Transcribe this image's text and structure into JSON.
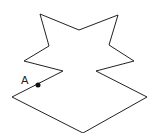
{
  "diagram": {
    "type": "polygon",
    "stroke_color": "#222222",
    "fill_color": "#ffffff",
    "vertices": [
      [
        40,
        14
      ],
      [
        79,
        30
      ],
      [
        118,
        15
      ],
      [
        109,
        45
      ],
      [
        134,
        61
      ],
      [
        96,
        71
      ],
      [
        147,
        97
      ],
      [
        83,
        133
      ],
      [
        12,
        97
      ],
      [
        63,
        71
      ],
      [
        24,
        61
      ],
      [
        49,
        46
      ]
    ],
    "point": {
      "label": "A",
      "x": 38,
      "y": 85,
      "color": "#111111"
    }
  }
}
